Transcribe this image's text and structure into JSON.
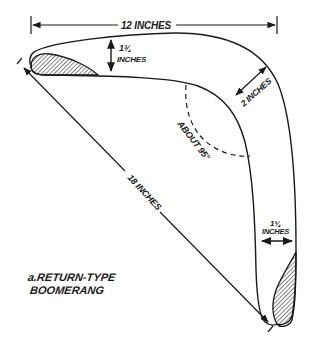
{
  "diagram": {
    "type": "dimensioned technical drawing",
    "subject": "return-type boomerang",
    "caption": {
      "line1": "a.RETURN-TYPE",
      "line2": "BOOMERANG"
    },
    "dimensions": {
      "overall_width": {
        "label": "12 INCHES",
        "value": 12,
        "unit": "inches"
      },
      "arm_width_top": {
        "label_fraction": "1¾",
        "label_unit": "INCHES",
        "value": 1.75,
        "unit": "inches"
      },
      "elbow_width": {
        "label": "2 INCHES",
        "value": 2,
        "unit": "inches"
      },
      "tip_to_tip": {
        "label": "18 INCHES",
        "value": 18,
        "unit": "inches"
      },
      "arm_width_bottom": {
        "label_fraction": "1¾",
        "label_unit": "INCHES",
        "value": 1.75,
        "unit": "inches"
      },
      "elbow_angle": {
        "label": "ABOUT 95°",
        "value": 95,
        "unit": "degrees"
      }
    },
    "features": [
      "hatched airfoil cross-section at upper-left tip",
      "hatched airfoil cross-section at lower-right tip",
      "dashed arc indicating elbow angle"
    ],
    "colors": {
      "ink": "#1a1a1a",
      "background": "#ffffff"
    }
  }
}
